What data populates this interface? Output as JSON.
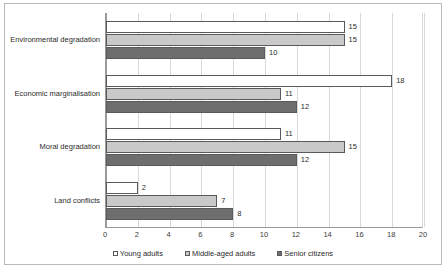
{
  "chart_data": {
    "type": "bar",
    "orientation": "horizontal",
    "title": "",
    "xlabel": "",
    "ylabel": "",
    "xlim": [
      0,
      20
    ],
    "xticks": [
      0,
      2,
      4,
      6,
      8,
      10,
      12,
      14,
      16,
      18,
      20
    ],
    "grid": true,
    "legend_position": "bottom",
    "categories": [
      "Environmental degradation",
      "Economic marginalisation",
      "Moral degradation",
      "Land conflicts"
    ],
    "series": [
      {
        "name": "Young adults",
        "color": "#ffffff",
        "values": [
          15,
          18,
          11,
          2
        ]
      },
      {
        "name": "Middle-aged adults",
        "color": "#c9c9c9",
        "values": [
          15,
          11,
          15,
          7
        ]
      },
      {
        "name": "Senior citizens",
        "color": "#6e6e6e",
        "values": [
          10,
          12,
          12,
          8
        ]
      }
    ]
  },
  "style": {
    "series_border": "#5a5a5a",
    "gridline": "#d8d8d8",
    "axis": "#9a9a9a",
    "frame": "#b9b9b9",
    "text": "#2b2b2b",
    "background": "#ffffff"
  }
}
